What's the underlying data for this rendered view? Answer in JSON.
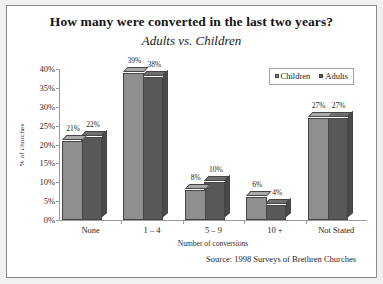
{
  "chart_data": {
    "type": "bar",
    "title": "How many were converted in the last two years?",
    "subtitle": "Adults vs. Children",
    "xlabel": "Number of conversions",
    "ylabel": "% of churches",
    "categories": [
      "None",
      "1 – 4",
      "5 – 9",
      "10 +",
      "Not Stated"
    ],
    "series": [
      {
        "name": "Children",
        "color": "#8f8f8f",
        "values": [
          21,
          39,
          8,
          6,
          27
        ],
        "labels": [
          "21%",
          "39%",
          "8%",
          "6%",
          "27%"
        ]
      },
      {
        "name": "Adults",
        "color": "#585858",
        "values": [
          22,
          38,
          10,
          4,
          27
        ],
        "labels": [
          "22%",
          "38%",
          "10%",
          "4%",
          "27%"
        ]
      }
    ],
    "ylim": [
      0,
      40
    ],
    "yticks": [
      0,
      5,
      10,
      15,
      20,
      25,
      30,
      35,
      40
    ],
    "ytick_labels": [
      "0%",
      "5%",
      "10%",
      "15%",
      "20%",
      "25%",
      "30%",
      "35%",
      "40%"
    ],
    "grid": false,
    "legend_position": "top-right",
    "source": "Source: 1998 Surveys of Brethren Churches"
  }
}
